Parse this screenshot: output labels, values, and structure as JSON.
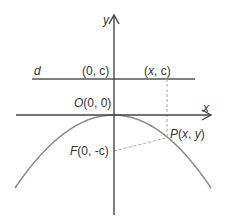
{
  "diagram": {
    "colors": {
      "axis": "#444444",
      "curve": "#888888",
      "dashed": "#aaaaaa",
      "text": "#333333"
    },
    "labels": {
      "y_axis": "y",
      "x_axis": "x",
      "directrix": "d",
      "directrix_point_left": "(0, c)",
      "directrix_point_right_var": "x",
      "directrix_point_right_rest": ", c)",
      "directrix_point_right_open": "(",
      "origin_letter": "O",
      "origin_coords": "(0, 0)",
      "focus_letter": "F",
      "focus_coords": "(0, -c)",
      "point_letter": "P",
      "point_open": "(",
      "point_x": "x",
      "point_comma": ", ",
      "point_y": "y",
      "point_close": ")"
    }
  }
}
